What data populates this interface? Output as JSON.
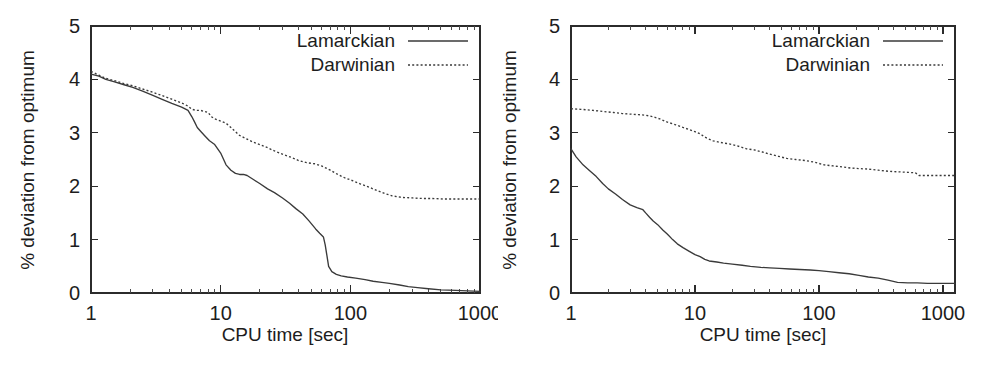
{
  "figure": {
    "background_color": "#ffffff",
    "line_color": "#3a3a3a",
    "axis_color": "#2b2b2b",
    "text_color": "#1d1d1d"
  },
  "panels": [
    {
      "id": "left",
      "xlabel": "CPU time [sec]",
      "ylabel": "% deviation from optimum",
      "xticks": [
        "1",
        "10",
        "100",
        "1000"
      ],
      "yticks": [
        "0",
        "1",
        "2",
        "3",
        "4",
        "5"
      ],
      "legend": [
        {
          "label": "Lamarckian",
          "style": "solid"
        },
        {
          "label": "Darwinian",
          "style": "dotted"
        }
      ]
    },
    {
      "id": "right",
      "xlabel": "CPU time [sec]",
      "ylabel": "% deviation from optimum",
      "xticks": [
        "1",
        "10",
        "100",
        "1000"
      ],
      "yticks": [
        "0",
        "1",
        "2",
        "3",
        "4",
        "5"
      ],
      "legend": [
        {
          "label": "Lamarckian",
          "style": "solid"
        },
        {
          "label": "Darwinian",
          "style": "dotted"
        }
      ]
    }
  ],
  "chart_data": [
    {
      "type": "line",
      "panel": "left",
      "title": "",
      "xlabel": "CPU time [sec]",
      "ylabel": "% deviation from optimum",
      "xscale": "log",
      "xlim": [
        1,
        1000
      ],
      "ylim": [
        0,
        5
      ],
      "xticks": [
        1,
        10,
        100,
        1000
      ],
      "yticks": [
        0,
        1,
        2,
        3,
        4,
        5
      ],
      "grid": false,
      "legend_position": "top-right",
      "series": [
        {
          "name": "Lamarckian",
          "style": "solid",
          "x": [
            1,
            1.15,
            1.3,
            1.5,
            1.8,
            2.1,
            2.5,
            3.0,
            3.5,
            4.2,
            5.0,
            5.6,
            6.0,
            6.3,
            6.6,
            7.0,
            7.5,
            8.2,
            9.0,
            10,
            11,
            12,
            13,
            14,
            15,
            16,
            18,
            20,
            23,
            26,
            30,
            34,
            38,
            43,
            48,
            54,
            58,
            62,
            64,
            66,
            68,
            72,
            78,
            85,
            95,
            110,
            130,
            150,
            175,
            200,
            240,
            280,
            330,
            400,
            500,
            650,
            800,
            1000
          ],
          "y": [
            4.1,
            4.06,
            4.0,
            3.96,
            3.9,
            3.85,
            3.78,
            3.7,
            3.63,
            3.55,
            3.48,
            3.42,
            3.3,
            3.2,
            3.1,
            3.03,
            2.95,
            2.85,
            2.78,
            2.62,
            2.4,
            2.3,
            2.24,
            2.22,
            2.22,
            2.2,
            2.12,
            2.05,
            1.95,
            1.88,
            1.78,
            1.68,
            1.58,
            1.48,
            1.35,
            1.2,
            1.12,
            1.05,
            0.9,
            0.7,
            0.5,
            0.4,
            0.35,
            0.32,
            0.3,
            0.28,
            0.25,
            0.22,
            0.2,
            0.18,
            0.15,
            0.12,
            0.1,
            0.08,
            0.06,
            0.05,
            0.04,
            0.03
          ]
        },
        {
          "name": "Darwinian",
          "style": "dotted",
          "x": [
            1,
            1.15,
            1.3,
            1.5,
            1.8,
            2.1,
            2.5,
            3.0,
            3.5,
            4.2,
            5.0,
            5.6,
            6.0,
            6.5,
            7.0,
            7.5,
            8.0,
            8.5,
            9.0,
            9.5,
            10,
            11,
            12,
            13,
            14,
            16,
            18,
            20,
            23,
            26,
            30,
            35,
            40,
            46,
            53,
            60,
            70,
            80,
            90,
            105,
            120,
            140,
            160,
            185,
            210,
            250,
            300,
            360,
            430,
            520,
            620,
            750,
            900,
            1000
          ],
          "y": [
            4.15,
            4.08,
            4.02,
            3.98,
            3.92,
            3.88,
            3.82,
            3.76,
            3.7,
            3.63,
            3.56,
            3.5,
            3.44,
            3.42,
            3.42,
            3.4,
            3.38,
            3.3,
            3.26,
            3.24,
            3.22,
            3.18,
            3.1,
            3.02,
            2.95,
            2.88,
            2.82,
            2.78,
            2.72,
            2.66,
            2.6,
            2.54,
            2.48,
            2.44,
            2.42,
            2.38,
            2.3,
            2.22,
            2.16,
            2.1,
            2.04,
            1.98,
            1.92,
            1.86,
            1.82,
            1.79,
            1.78,
            1.77,
            1.77,
            1.76,
            1.76,
            1.76,
            1.76,
            1.76
          ]
        }
      ]
    },
    {
      "type": "line",
      "panel": "right",
      "title": "",
      "xlabel": "CPU time [sec]",
      "ylabel": "% deviation from optimum",
      "xscale": "log",
      "xlim": [
        1,
        1250
      ],
      "ylim": [
        0,
        5
      ],
      "xticks": [
        1,
        10,
        100,
        1000
      ],
      "yticks": [
        0,
        1,
        2,
        3,
        4,
        5
      ],
      "grid": false,
      "legend_position": "top-right",
      "series": [
        {
          "name": "Lamarckian",
          "style": "solid",
          "x": [
            1,
            1.1,
            1.25,
            1.4,
            1.6,
            1.8,
            2.0,
            2.3,
            2.6,
            3.0,
            3.4,
            3.8,
            4.0,
            4.3,
            4.6,
            5.0,
            5.5,
            6.0,
            6.6,
            7.2,
            8.0,
            9.0,
            10,
            11,
            12,
            13,
            15,
            17,
            20,
            24,
            28,
            34,
            40,
            48,
            58,
            70,
            85,
            100,
            120,
            145,
            175,
            210,
            250,
            300,
            360,
            430,
            520,
            620,
            750,
            900,
            1100,
            1250
          ],
          "y": [
            2.7,
            2.55,
            2.4,
            2.3,
            2.18,
            2.05,
            1.95,
            1.85,
            1.75,
            1.65,
            1.6,
            1.56,
            1.5,
            1.42,
            1.35,
            1.28,
            1.18,
            1.1,
            1.0,
            0.92,
            0.85,
            0.78,
            0.72,
            0.68,
            0.63,
            0.6,
            0.58,
            0.56,
            0.54,
            0.52,
            0.5,
            0.48,
            0.47,
            0.46,
            0.45,
            0.44,
            0.43,
            0.42,
            0.4,
            0.38,
            0.36,
            0.33,
            0.3,
            0.28,
            0.24,
            0.2,
            0.19,
            0.19,
            0.18,
            0.18,
            0.18,
            0.18
          ]
        },
        {
          "name": "Darwinian",
          "style": "dotted",
          "x": [
            1,
            1.2,
            1.5,
            1.8,
            2.2,
            2.6,
            3.0,
            3.5,
            4.0,
            4.6,
            5.2,
            6.0,
            7.0,
            8.0,
            9.0,
            10,
            11,
            12,
            13,
            14,
            16,
            18,
            20,
            23,
            26,
            30,
            35,
            40,
            47,
            55,
            65,
            78,
            92,
            110,
            130,
            155,
            180,
            210,
            250,
            300,
            360,
            430,
            520,
            600,
            640,
            700,
            800,
            950,
            1100,
            1250
          ],
          "y": [
            3.45,
            3.44,
            3.42,
            3.4,
            3.38,
            3.36,
            3.35,
            3.34,
            3.33,
            3.3,
            3.26,
            3.2,
            3.15,
            3.1,
            3.06,
            3.02,
            2.98,
            2.92,
            2.88,
            2.85,
            2.82,
            2.8,
            2.78,
            2.74,
            2.7,
            2.68,
            2.64,
            2.6,
            2.56,
            2.52,
            2.5,
            2.48,
            2.45,
            2.4,
            2.38,
            2.36,
            2.34,
            2.33,
            2.32,
            2.3,
            2.28,
            2.27,
            2.26,
            2.25,
            2.2,
            2.2,
            2.2,
            2.2,
            2.2,
            2.2
          ]
        }
      ]
    }
  ]
}
